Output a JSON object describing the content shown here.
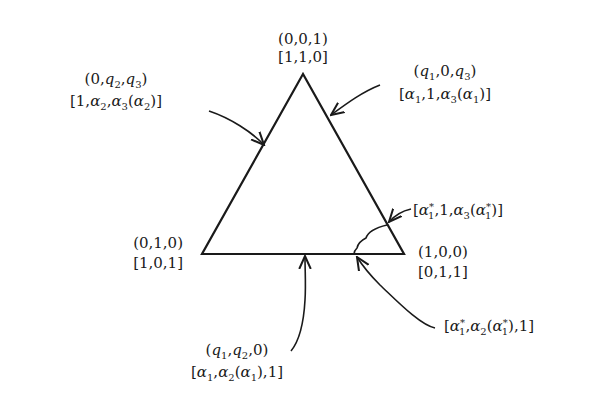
{
  "diagram": {
    "vertices": {
      "top": {
        "coords": "(0,0,1)",
        "image": "[1,1,0]"
      },
      "left": {
        "coords": "(0,1,0)",
        "image": "[1,0,1]"
      },
      "right": {
        "coords": "(1,0,0)",
        "image": "[0,1,1]"
      }
    },
    "edge_labels": {
      "left_edge": {
        "coords": "(0,q2,q3)",
        "image": "[1,α2,α3(α2)]"
      },
      "right_edge": {
        "coords": "(q1,0,q3)",
        "image": "[α1,1,α3(α1)]"
      },
      "bottom_edge": {
        "coords": "(q1,q2,0)",
        "image": "[α1,α2(α1),1]"
      }
    },
    "corner_labels": {
      "upper_point": "[α1*,1,α3(α1*)]",
      "lower_point": "[α1*,α2(α1*),1]"
    },
    "colors": {
      "ink": "#1a1a1a",
      "background": "#ffffff"
    }
  }
}
